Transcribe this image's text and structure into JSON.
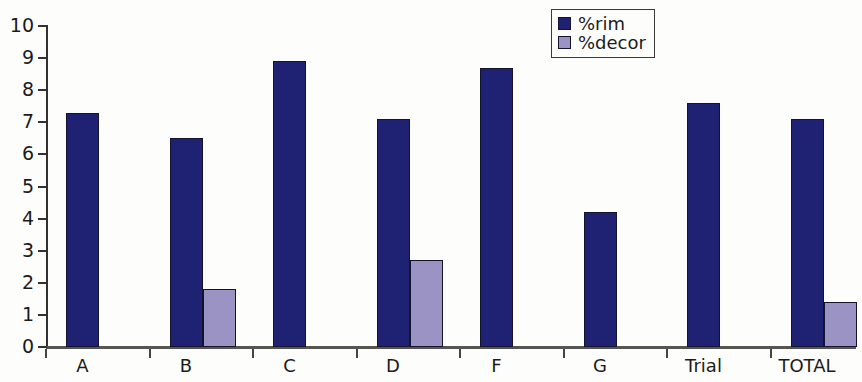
{
  "chart_data": {
    "type": "bar",
    "title": "",
    "xlabel": "",
    "ylabel": "",
    "ylim": [
      0,
      10
    ],
    "ytick_labels": [
      "10",
      "9",
      "8",
      "7",
      "6",
      "5",
      "4",
      "3",
      "2",
      "1",
      "0"
    ],
    "grid": false,
    "legend_position": "top-right",
    "categories": [
      "A",
      "B",
      "C",
      "D",
      "F",
      "G",
      "Trial",
      "TOTAL"
    ],
    "series": [
      {
        "name": "%rim",
        "color": "#1f2273",
        "values": [
          7.3,
          6.5,
          8.9,
          7.1,
          8.7,
          4.2,
          7.6,
          7.1
        ]
      },
      {
        "name": "%decor",
        "color": "#9a93c4",
        "values": [
          0,
          1.8,
          0,
          2.7,
          0,
          0,
          0,
          1.4
        ]
      }
    ]
  },
  "colors": {
    "rim": "#1f2273",
    "decor": "#9a93c4",
    "axis": "#33322f",
    "background": "#fdfdfb"
  }
}
